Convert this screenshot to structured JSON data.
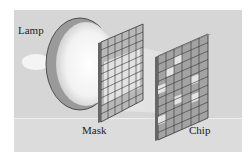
{
  "diagram": {
    "labels": {
      "lamp": "Lamp",
      "mask": "Mask",
      "chip": "Chip"
    },
    "mask_grid": {
      "columns": 6,
      "rows": 10
    },
    "chip_grid": {
      "columns": 6,
      "rows": 10
    },
    "colors": {
      "background": "#d6d6d6",
      "grid_cell": "#9a9a9a",
      "grid_line": "#333333",
      "exposed_cell": "#e6e6e6",
      "lamp_rim": "#8c8c8c"
    }
  }
}
